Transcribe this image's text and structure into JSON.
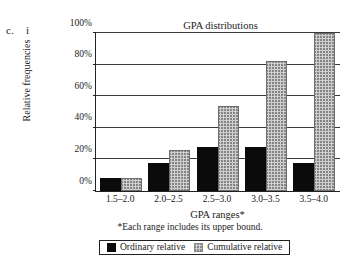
{
  "figure": {
    "problem_label": "c.",
    "subpart_label": "i"
  },
  "chart_data": {
    "type": "bar",
    "title": "GPA distributions",
    "xlabel": "GPA ranges*",
    "ylabel": "Relative frequencies",
    "footnote": "*Each range includes its upper bound.",
    "categories": [
      "1.5–2.0",
      "2.0–2.5",
      "2.5–3.0",
      "3.0–3.5",
      "3.5–4.0"
    ],
    "series": [
      {
        "name": "Ordinary relative",
        "color": "#0b0b0b",
        "values": [
          8,
          18,
          28,
          28,
          18
        ]
      },
      {
        "name": "Cumulative relative",
        "color": "#cfcfcf",
        "values": [
          8,
          26,
          54,
          82,
          100
        ]
      }
    ],
    "ylim": [
      0,
      100
    ],
    "yticks": [
      0,
      20,
      40,
      60,
      80,
      100
    ],
    "ytick_labels": [
      "0%",
      "20%",
      "40%",
      "60%",
      "80%",
      "100%"
    ],
    "grid": true,
    "legend_position": "bottom"
  }
}
